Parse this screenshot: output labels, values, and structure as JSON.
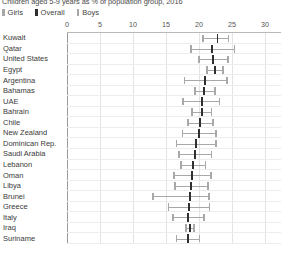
{
  "chart_data": {
    "type": "range-dot",
    "title": "Children aged 5-9 years as % of population group, 2016",
    "xlabel": "",
    "ylabel": "",
    "xlim": [
      0,
      30
    ],
    "xticks": [
      0,
      5,
      10,
      15,
      20,
      25,
      30
    ],
    "grid": true,
    "legend_position": "top-left",
    "legend": [
      {
        "name": "Girls",
        "color": "#a8a8a8",
        "marker": "cap"
      },
      {
        "name": "Overall",
        "color": "#2f2f2f",
        "marker": "tick"
      },
      {
        "name": "Boys",
        "color": "#a8a8a8",
        "marker": "cap"
      }
    ],
    "categories": [
      "Kuwait",
      "Qatar",
      "United States",
      "Egypt",
      "Argentina",
      "Bahamas",
      "UAE",
      "Bahrain",
      "Chile",
      "New Zealand",
      "Dominican Rep.",
      "Saudi Arabia",
      "Lebanon",
      "Oman",
      "Libya",
      "Brunei",
      "Greece",
      "Italy",
      "Iraq",
      "Suriname"
    ],
    "series": [
      {
        "name": "Girls",
        "values": [
          20.6,
          18.8,
          20.0,
          21.2,
          17.8,
          19.4,
          17.6,
          18.9,
          18.3,
          17.5,
          16.6,
          17.0,
          17.3,
          16.2,
          16.4,
          13.0,
          15.4,
          16.1,
          18.0,
          16.6
        ]
      },
      {
        "name": "Overall",
        "values": [
          22.8,
          22.0,
          22.1,
          22.4,
          20.9,
          20.8,
          20.4,
          20.4,
          20.2,
          20.0,
          19.6,
          19.4,
          19.1,
          19.0,
          18.8,
          18.6,
          18.5,
          18.4,
          18.6,
          18.4
        ]
      },
      {
        "name": "Boys",
        "values": [
          24.5,
          25.4,
          24.4,
          23.6,
          24.2,
          22.4,
          23.1,
          21.9,
          22.1,
          22.6,
          22.6,
          21.9,
          21.0,
          21.8,
          21.4,
          21.5,
          21.6,
          20.8,
          19.2,
          20.1
        ]
      }
    ]
  }
}
